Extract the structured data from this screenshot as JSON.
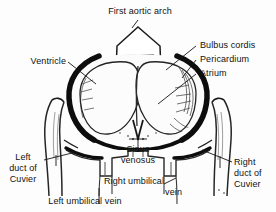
{
  "figure": {
    "ink_color": "#111111",
    "background_color": "#fdfdfd"
  },
  "labels": {
    "first_aortic_arch": "First aortic arch",
    "ventricle": "Ventricle",
    "bulbus_cordis": "Bulbus cordis",
    "pericardium": "Pericardium",
    "atrium": "Atrium",
    "sinus_venosus_line1": "Sinus",
    "sinus_venosus_line2": "venosus",
    "left_duct_line1": "Left",
    "left_duct_line2": "duct of",
    "left_duct_line3": "Cuvier",
    "right_duct_line1": "Right",
    "right_duct_line2": "duct of",
    "right_duct_line3": "Cuvier",
    "right_umbilical_line1": "Right umbilical",
    "right_umbilical_line2": "vein",
    "left_umbilical_vein": "Left umbilical vein"
  }
}
